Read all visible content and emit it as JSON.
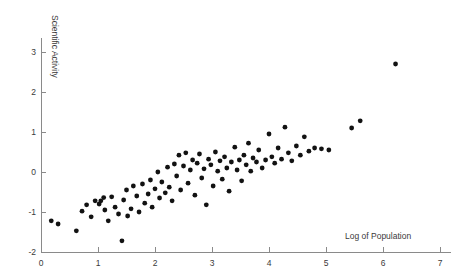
{
  "chart_data": {
    "type": "scatter",
    "title": "",
    "xlabel": "Log of Population",
    "ylabel": "Scientific Activity",
    "xlim": [
      0,
      7.2
    ],
    "ylim": [
      -2,
      3.35
    ],
    "xticks": [
      0,
      1,
      2,
      3,
      4,
      5,
      6,
      7
    ],
    "xtick_labels": [
      "0",
      "1",
      "2",
      "3",
      "4",
      "5",
      "6",
      "7"
    ],
    "yticks": [
      -2,
      -1,
      0,
      1,
      2,
      3
    ],
    "ytick_labels": [
      "-2",
      "-1",
      "0",
      "1",
      "2",
      "3"
    ],
    "grid": false,
    "legend": null,
    "marker": "filled-circle",
    "marker_color": "#121212",
    "marker_size": 3,
    "points": [
      [
        0.18,
        -1.22
      ],
      [
        0.3,
        -1.3
      ],
      [
        0.62,
        -1.47
      ],
      [
        0.72,
        -0.98
      ],
      [
        0.8,
        -0.82
      ],
      [
        0.88,
        -1.12
      ],
      [
        0.95,
        -0.72
      ],
      [
        1.02,
        -0.8
      ],
      [
        1.05,
        -0.72
      ],
      [
        1.1,
        -0.64
      ],
      [
        1.12,
        -0.95
      ],
      [
        1.18,
        -1.22
      ],
      [
        1.24,
        -0.62
      ],
      [
        1.3,
        -0.88
      ],
      [
        1.36,
        -1.05
      ],
      [
        1.42,
        -1.72
      ],
      [
        1.45,
        -0.7
      ],
      [
        1.5,
        -0.45
      ],
      [
        1.52,
        -1.1
      ],
      [
        1.58,
        -0.92
      ],
      [
        1.62,
        -0.35
      ],
      [
        1.68,
        -0.6
      ],
      [
        1.72,
        -1.0
      ],
      [
        1.78,
        -0.3
      ],
      [
        1.82,
        -0.78
      ],
      [
        1.88,
        -0.55
      ],
      [
        1.92,
        -0.2
      ],
      [
        1.95,
        -0.88
      ],
      [
        2.0,
        -0.42
      ],
      [
        2.05,
        0.0
      ],
      [
        2.08,
        -0.65
      ],
      [
        2.12,
        -0.25
      ],
      [
        2.18,
        -0.52
      ],
      [
        2.22,
        0.12
      ],
      [
        2.25,
        -0.38
      ],
      [
        2.3,
        -0.72
      ],
      [
        2.34,
        0.2
      ],
      [
        2.38,
        -0.1
      ],
      [
        2.42,
        0.42
      ],
      [
        2.45,
        -0.45
      ],
      [
        2.5,
        0.15
      ],
      [
        2.54,
        0.48
      ],
      [
        2.58,
        -0.28
      ],
      [
        2.62,
        0.05
      ],
      [
        2.66,
        0.3
      ],
      [
        2.7,
        -0.58
      ],
      [
        2.74,
        0.22
      ],
      [
        2.78,
        0.45
      ],
      [
        2.82,
        -0.15
      ],
      [
        2.86,
        0.08
      ],
      [
        2.9,
        -0.82
      ],
      [
        2.94,
        0.32
      ],
      [
        2.98,
        0.18
      ],
      [
        3.02,
        -0.35
      ],
      [
        3.06,
        0.5
      ],
      [
        3.1,
        0.02
      ],
      [
        3.14,
        0.28
      ],
      [
        3.18,
        -0.18
      ],
      [
        3.22,
        0.38
      ],
      [
        3.26,
        0.1
      ],
      [
        3.3,
        -0.48
      ],
      [
        3.34,
        0.25
      ],
      [
        3.4,
        0.62
      ],
      [
        3.44,
        0.05
      ],
      [
        3.48,
        0.3
      ],
      [
        3.52,
        -0.22
      ],
      [
        3.56,
        0.42
      ],
      [
        3.6,
        0.18
      ],
      [
        3.64,
        0.72
      ],
      [
        3.68,
        0.02
      ],
      [
        3.72,
        0.35
      ],
      [
        3.78,
        0.25
      ],
      [
        3.82,
        0.55
      ],
      [
        3.88,
        0.1
      ],
      [
        3.94,
        0.3
      ],
      [
        4.0,
        0.95
      ],
      [
        4.05,
        0.38
      ],
      [
        4.1,
        0.22
      ],
      [
        4.16,
        0.6
      ],
      [
        4.22,
        0.32
      ],
      [
        4.28,
        1.12
      ],
      [
        4.34,
        0.48
      ],
      [
        4.4,
        0.28
      ],
      [
        4.48,
        0.65
      ],
      [
        4.55,
        0.42
      ],
      [
        4.62,
        0.88
      ],
      [
        4.7,
        0.52
      ],
      [
        4.8,
        0.6
      ],
      [
        4.92,
        0.58
      ],
      [
        5.05,
        0.55
      ],
      [
        5.45,
        1.1
      ],
      [
        5.6,
        1.28
      ],
      [
        6.22,
        2.7
      ]
    ]
  }
}
